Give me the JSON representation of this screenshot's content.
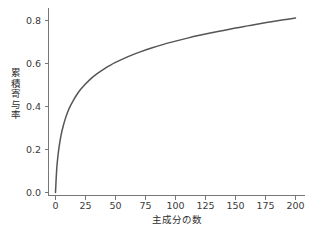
{
  "chart_data": {
    "type": "line",
    "title": "",
    "subtitle": "",
    "xlabel": "主成分の数",
    "ylabel": "累積寄与率",
    "xlim": [
      -8,
      208
    ],
    "ylim": [
      -0.03,
      0.9
    ],
    "grid": false,
    "legend": null,
    "legend_position": "none",
    "line_color": "#555555",
    "background_color": "#ffffff",
    "axis_color": "#777777",
    "text_color": "#2e2e2e",
    "xticks": [
      0,
      25,
      50,
      75,
      100,
      125,
      150,
      175,
      200
    ],
    "xtick_labels": [
      "0",
      "25",
      "50",
      "75",
      "100",
      "125",
      "150",
      "175",
      "200"
    ],
    "yticks": [
      0.0,
      0.2,
      0.4,
      0.6,
      0.8
    ],
    "ytick_labels": [
      "0.0",
      "0.2",
      "0.4",
      "0.6",
      "0.8"
    ],
    "series": [
      {
        "name": "cumulative-explained-variance",
        "x": [
          0,
          1,
          2,
          3,
          4,
          5,
          6,
          8,
          10,
          12,
          15,
          18,
          21,
          25,
          30,
          35,
          40,
          45,
          50,
          60,
          70,
          80,
          90,
          100,
          110,
          120,
          130,
          140,
          150,
          160,
          170,
          180,
          190,
          200
        ],
        "values": [
          0.0,
          0.108,
          0.168,
          0.212,
          0.247,
          0.276,
          0.3,
          0.34,
          0.372,
          0.398,
          0.43,
          0.457,
          0.48,
          0.505,
          0.532,
          0.554,
          0.573,
          0.59,
          0.605,
          0.631,
          0.653,
          0.672,
          0.689,
          0.704,
          0.718,
          0.731,
          0.743,
          0.754,
          0.765,
          0.775,
          0.785,
          0.794,
          0.803,
          0.812
        ]
      }
    ],
    "annotations": []
  },
  "figure": {
    "name": "cumulative-contribution-ratio-plot"
  }
}
